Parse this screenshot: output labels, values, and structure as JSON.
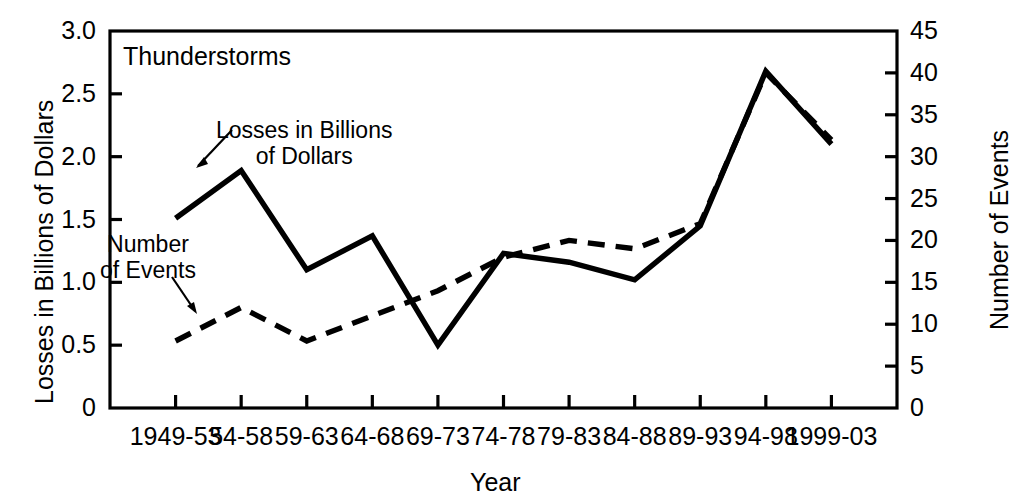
{
  "chart_data": {
    "type": "line",
    "title": "Thunderstorms",
    "xlabel": "Year",
    "ylabel": "Losses in Billions of Dollars",
    "y2label": "Number of Events",
    "categories": [
      "1949-53",
      "54-58",
      "59-63",
      "64-68",
      "69-73",
      "74-78",
      "79-83",
      "84-88",
      "89-93",
      "94-98",
      "1999-03"
    ],
    "ylim": [
      0,
      3.0
    ],
    "y2lim": [
      0,
      45
    ],
    "yticks": [
      "0",
      "0.5",
      "1.0",
      "1.5",
      "2.0",
      "2.5",
      "3.0"
    ],
    "ytick_values": [
      0,
      0.5,
      1.0,
      1.5,
      2.0,
      2.5,
      3.0
    ],
    "y2ticks": [
      "0",
      "5",
      "10",
      "15",
      "20",
      "25",
      "30",
      "35",
      "40",
      "45"
    ],
    "y2tick_values": [
      0,
      5,
      10,
      15,
      20,
      25,
      30,
      35,
      40,
      45
    ],
    "grid": false,
    "legend_position": "inline-annotations",
    "series": [
      {
        "name": "Losses in Billions of Dollars",
        "axis": "left",
        "style": "solid",
        "color": "#000000",
        "values": [
          1.51,
          1.89,
          1.1,
          1.37,
          0.5,
          1.23,
          1.16,
          1.02,
          1.45,
          2.68,
          2.1
        ]
      },
      {
        "name": "Number of Events",
        "axis": "right",
        "style": "dashed",
        "color": "#000000",
        "values": [
          8,
          12,
          8,
          11,
          14,
          18,
          20,
          19,
          22,
          40,
          32
        ]
      }
    ],
    "annotations": [
      {
        "label_line1": "Losses in Billions",
        "label_line2": "of Dollars",
        "target_category": "54-58",
        "target_series": "Losses in Billions of Dollars"
      },
      {
        "label_line1": "Number",
        "label_line2": "of Events",
        "target_category": "54-58",
        "target_series": "Number of Events"
      }
    ]
  },
  "labels": {
    "title": "Thunderstorms",
    "xlabel": "Year",
    "ylabel": "Losses in Billions of Dollars",
    "y2label": "Number of Events",
    "annotation_losses_l1": "Losses in Billions",
    "annotation_losses_l2": "of Dollars",
    "annotation_events_l1": "Number",
    "annotation_events_l2": "of Events"
  }
}
